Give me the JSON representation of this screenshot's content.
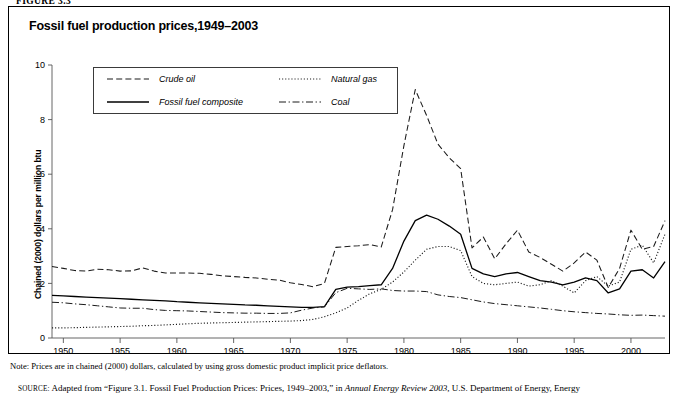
{
  "figure": {
    "number_label": "FIGURE 3.3",
    "title": "Fossil fuel production prices,1949–2003"
  },
  "legend": {
    "items": [
      {
        "label": "Crude oil",
        "style": "dashed",
        "color": "#1a1a1a"
      },
      {
        "label": "Natural gas",
        "style": "dotted",
        "color": "#1a1a1a"
      },
      {
        "label": "Fossil fuel composite",
        "style": "solid",
        "color": "#000000"
      },
      {
        "label": "Coal",
        "style": "dashdot",
        "color": "#1a1a1a"
      }
    ]
  },
  "footer": {
    "note": "Note: Prices are in chained (2000) dollars, calculated by using gross domestic product implicit price deflators.",
    "source_prefix": "SOURCE:",
    "source_part1": " Adapted from “Figure 3.1. Fossil Fuel Production Prices: Prices, 1949–2003,” in ",
    "source_italic": "Annual Energy Review 2003",
    "source_part2": ", U.S. Department of Energy, Energy"
  },
  "chart_data": {
    "type": "line",
    "title": "Fossil fuel production prices,1949–2003",
    "xlabel": "",
    "ylabel": "Chained (2000) dollars per million btu",
    "xlim": [
      1949,
      2003
    ],
    "ylim": [
      0,
      10
    ],
    "yticks": [
      0,
      2,
      4,
      6,
      8,
      10
    ],
    "ytick_labels": [
      "0",
      "2",
      "4",
      "6",
      "8",
      "10"
    ],
    "xticks": [
      1950,
      1955,
      1960,
      1965,
      1970,
      1975,
      1980,
      1985,
      1990,
      1995,
      2000
    ],
    "xtick_labels": [
      "1950",
      "1955",
      "1960",
      "1965",
      "1970",
      "1975",
      "1980",
      "1985",
      "1990",
      "1995",
      "2000"
    ],
    "grid": false,
    "legend_position": "upper-left-inside",
    "x": [
      1949,
      1950,
      1951,
      1952,
      1953,
      1954,
      1955,
      1956,
      1957,
      1958,
      1959,
      1960,
      1961,
      1962,
      1963,
      1964,
      1965,
      1966,
      1967,
      1968,
      1969,
      1970,
      1971,
      1972,
      1973,
      1974,
      1975,
      1976,
      1977,
      1978,
      1979,
      1980,
      1981,
      1982,
      1983,
      1984,
      1985,
      1986,
      1987,
      1988,
      1989,
      1990,
      1991,
      1992,
      1993,
      1994,
      1995,
      1996,
      1997,
      1998,
      1999,
      2000,
      2001,
      2002,
      2003
    ],
    "series": [
      {
        "name": "Crude oil",
        "style": "dashed",
        "values": [
          2.62,
          2.55,
          2.47,
          2.45,
          2.52,
          2.5,
          2.45,
          2.46,
          2.57,
          2.45,
          2.38,
          2.38,
          2.38,
          2.37,
          2.33,
          2.28,
          2.25,
          2.22,
          2.2,
          2.15,
          2.12,
          2.02,
          1.96,
          1.88,
          2.0,
          3.32,
          3.35,
          3.38,
          3.42,
          3.33,
          4.7,
          7.05,
          9.1,
          8.15,
          7.1,
          6.6,
          6.2,
          3.3,
          3.7,
          2.9,
          3.45,
          3.95,
          3.15,
          2.95,
          2.7,
          2.45,
          2.75,
          3.15,
          2.85,
          1.85,
          2.55,
          3.95,
          3.25,
          3.35,
          4.3
        ]
      },
      {
        "name": "Fossil fuel composite",
        "style": "solid",
        "values": [
          1.56,
          1.54,
          1.52,
          1.5,
          1.48,
          1.46,
          1.44,
          1.42,
          1.4,
          1.38,
          1.36,
          1.33,
          1.31,
          1.29,
          1.27,
          1.25,
          1.23,
          1.21,
          1.2,
          1.18,
          1.16,
          1.14,
          1.12,
          1.12,
          1.15,
          1.78,
          1.86,
          1.88,
          1.92,
          1.95,
          2.55,
          3.55,
          4.3,
          4.5,
          4.35,
          4.1,
          3.8,
          2.55,
          2.35,
          2.25,
          2.35,
          2.4,
          2.25,
          2.1,
          2.05,
          1.95,
          2.05,
          2.2,
          2.1,
          1.65,
          1.8,
          2.45,
          2.5,
          2.2,
          2.8
        ]
      },
      {
        "name": "Natural gas",
        "style": "dotted",
        "values": [
          0.37,
          0.37,
          0.38,
          0.39,
          0.4,
          0.41,
          0.42,
          0.43,
          0.45,
          0.46,
          0.48,
          0.5,
          0.52,
          0.54,
          0.55,
          0.56,
          0.57,
          0.58,
          0.59,
          0.6,
          0.61,
          0.62,
          0.64,
          0.68,
          0.78,
          0.92,
          1.1,
          1.38,
          1.62,
          1.78,
          2.05,
          2.42,
          2.85,
          3.25,
          3.35,
          3.35,
          3.2,
          2.25,
          2.0,
          1.95,
          2.0,
          2.05,
          1.9,
          1.95,
          2.1,
          1.9,
          1.65,
          2.1,
          2.25,
          1.9,
          2.05,
          3.25,
          3.4,
          2.75,
          3.8
        ]
      },
      {
        "name": "Coal",
        "style": "dashdot",
        "values": [
          1.31,
          1.29,
          1.25,
          1.22,
          1.18,
          1.14,
          1.1,
          1.09,
          1.09,
          1.04,
          1.01,
          1.0,
          0.99,
          0.97,
          0.95,
          0.93,
          0.92,
          0.91,
          0.91,
          0.9,
          0.9,
          0.92,
          1.02,
          1.1,
          1.14,
          1.66,
          1.82,
          1.8,
          1.78,
          1.8,
          1.74,
          1.72,
          1.72,
          1.7,
          1.58,
          1.52,
          1.48,
          1.4,
          1.32,
          1.26,
          1.22,
          1.18,
          1.14,
          1.1,
          1.05,
          1.0,
          0.96,
          0.93,
          0.9,
          0.88,
          0.85,
          0.83,
          0.84,
          0.82,
          0.8
        ]
      }
    ]
  }
}
